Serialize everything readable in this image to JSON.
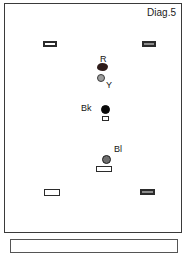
{
  "diagram": {
    "title": "Diag.5",
    "caption": "",
    "background_color": "#ffffff",
    "border_color": "#3a3a3a",
    "frame": {
      "x": 4,
      "y": 3,
      "width": 178,
      "height": 230
    }
  },
  "caption_box": {
    "text": "",
    "border_color": "#555555",
    "clipped": true
  },
  "markers": [
    {
      "id": "corner-top-left",
      "kind": "rectangle",
      "style": "dark",
      "label": "",
      "x": 42,
      "y": 40,
      "width": 14,
      "height": 6,
      "color": "#2b2b2b"
    },
    {
      "id": "corner-top-right",
      "kind": "rectangle",
      "style": "gray",
      "label": "",
      "x": 141,
      "y": 40,
      "width": 14,
      "height": 6,
      "color": "#8c8c8c"
    },
    {
      "id": "player-red",
      "kind": "blob",
      "style": "red",
      "label": "R",
      "label_x": 99,
      "label_y": 53,
      "x": 96,
      "y": 62,
      "width": 11,
      "height": 8,
      "color": "#2e1b19"
    },
    {
      "id": "player-yellow",
      "kind": "circle",
      "style": "yellow",
      "label": "Y",
      "label_x": 105,
      "label_y": 79,
      "x": 96,
      "y": 73,
      "width": 8,
      "height": 8,
      "color": "#9d9d9d"
    },
    {
      "id": "player-black",
      "kind": "circle",
      "style": "black",
      "label": "Bk",
      "label_x": 80,
      "label_y": 102,
      "x": 100,
      "y": 104,
      "width": 9,
      "height": 9,
      "color": "#0a0a0a"
    },
    {
      "id": "marker-black-base",
      "kind": "rectangle",
      "style": "tiny",
      "label": "",
      "x": 101,
      "y": 115,
      "width": 7,
      "height": 5,
      "color": "#ffffff"
    },
    {
      "id": "player-blue",
      "kind": "circle",
      "style": "blue",
      "label": "Bl",
      "label_x": 113,
      "label_y": 143,
      "x": 101,
      "y": 154,
      "width": 9,
      "height": 9,
      "color": "#6e6e6e"
    },
    {
      "id": "marker-blue-base",
      "kind": "rectangle",
      "style": "white",
      "label": "",
      "x": 95,
      "y": 165,
      "width": 16,
      "height": 6,
      "color": "#ffffff"
    },
    {
      "id": "corner-bottom-left",
      "kind": "rectangle",
      "style": "white",
      "label": "",
      "x": 43,
      "y": 188,
      "width": 16,
      "height": 7,
      "color": "#ffffff"
    },
    {
      "id": "corner-bottom-right",
      "kind": "rectangle",
      "style": "gray",
      "label": "",
      "x": 139,
      "y": 188,
      "width": 15,
      "height": 6,
      "color": "#8c8c8c"
    }
  ]
}
